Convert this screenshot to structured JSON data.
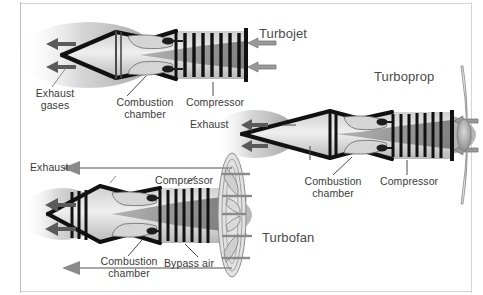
{
  "figure": {
    "background_color": "#ffffff",
    "frame_color": "#b9b9b9",
    "text_color": "#3a3a3a",
    "engine_outline_color": "#111111",
    "plume_color": "#9a9a9a"
  },
  "engines": [
    {
      "id": "turbojet",
      "name": "Turbojet",
      "labels": [
        {
          "key": "exhaust_gases",
          "text": "Exhaust\ngases"
        },
        {
          "key": "combustion_chamber",
          "text": "Combustion\nchamber"
        },
        {
          "key": "compressor",
          "text": "Compressor"
        }
      ],
      "flow": {
        "intake_arrows": 2,
        "exhaust_arrows": 2
      },
      "compressor_blades": 7
    },
    {
      "id": "turboprop",
      "name": "Turboprop",
      "labels": [
        {
          "key": "exhaust",
          "text": "Exhaust"
        },
        {
          "key": "combustion_chamber",
          "text": "Combustion\nchamber"
        },
        {
          "key": "compressor",
          "text": "Compressor"
        }
      ],
      "flow": {
        "intake_arrows": 2,
        "exhaust_arrows": 2
      },
      "compressor_blades": 8,
      "propeller_blades": 2
    },
    {
      "id": "turbofan",
      "name": "Turbofan",
      "labels": [
        {
          "key": "exhaust",
          "text": "Exhaust"
        },
        {
          "key": "compressor",
          "text": "Compressor"
        },
        {
          "key": "combustion_chamber",
          "text": "Combustion\nchamber"
        },
        {
          "key": "bypass_air",
          "text": "Bypass air"
        }
      ],
      "flow": {
        "intake_arrows": 2,
        "exhaust_arrows": 2,
        "bypass_arrows": 2
      },
      "compressor_blades": 9,
      "fan_blades": 5
    }
  ]
}
